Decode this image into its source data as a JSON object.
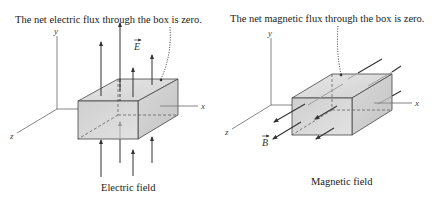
{
  "panels": [
    {
      "id": "electric",
      "annotation": "The net electric flux through the box is zero.",
      "caption": "Electric field",
      "vector_label": "E",
      "axes": {
        "x": "x",
        "y": "y",
        "z": "z"
      }
    },
    {
      "id": "magnetic",
      "annotation": "The net magnetic flux through the box is zero.",
      "caption": "Magnetic field",
      "vector_label": "B",
      "axes": {
        "x": "x",
        "y": "y",
        "z": "z"
      }
    }
  ],
  "colors": {
    "line": "#333333",
    "box_front": "#d6d6d6",
    "box_top": "#e4e4e4",
    "box_side": "#cbcbcb",
    "axis": "#666666"
  }
}
